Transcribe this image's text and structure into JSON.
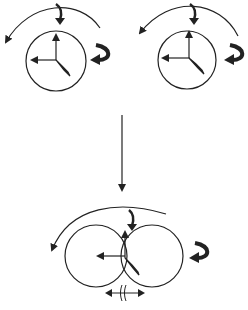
{
  "diagram": {
    "title": "",
    "stroke_color": "#222222",
    "background": "#ffffff",
    "panels": [
      {
        "id": "top-left",
        "label": "",
        "circle": {
          "cx": 56,
          "cy": 61,
          "r": 30
        }
      },
      {
        "id": "top-right",
        "label": "",
        "circle": {
          "cx": 187,
          "cy": 60,
          "r": 29
        }
      },
      {
        "id": "bottom-merged",
        "label": "",
        "circles": [
          {
            "cx": 96,
            "cy": 256,
            "r": 31
          },
          {
            "cx": 152,
            "cy": 256,
            "r": 31
          }
        ]
      }
    ],
    "transition_arrow": {
      "x": 122,
      "y1": 115,
      "y2": 190
    }
  }
}
